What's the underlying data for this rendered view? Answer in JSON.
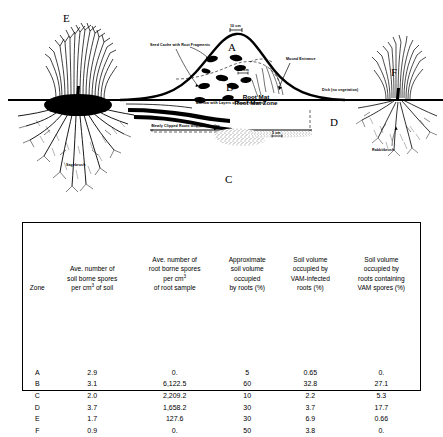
{
  "figure": {
    "zone_letters": [
      {
        "id": "E",
        "label": "E"
      },
      {
        "id": "A",
        "label": "A"
      },
      {
        "id": "B",
        "label": "B"
      },
      {
        "id": "C",
        "label": "C"
      },
      {
        "id": "D",
        "label": "D"
      },
      {
        "id": "F",
        "label": "F"
      }
    ],
    "annotations": {
      "scale_top": "10 cm",
      "scale_mid": "10 cm",
      "scale_bottom": "5 cm",
      "seed_cache": "Seed Cache with Root Fragments",
      "mound_entrance": "Mound Entrance",
      "root_mat_zone": "Root Mat Zone",
      "burrow": "Burrow with Layers of Root Fragments",
      "newly_clipped": "Newly Clipped Roots with Arbuscules",
      "disk": "Disk (no vegetation)",
      "sagebrush": "Sagebrush",
      "rabbitbrush": "Rabbitbrush"
    }
  },
  "table": {
    "headers": [
      {
        "lines": [
          "Zone"
        ],
        "sup": null
      },
      {
        "lines": [
          "Ave. number of",
          "soil borne spores",
          "per cm",
          " of soil"
        ],
        "sup": "3"
      },
      {
        "lines": [
          "Ave. number of",
          "root borne spores",
          "per cm",
          "of root sample"
        ],
        "sup": "3"
      },
      {
        "lines": [
          "Approximate",
          "soil volume",
          "occupied",
          "by roots (%)"
        ],
        "sup": null
      },
      {
        "lines": [
          "Soil volume",
          "occupied by",
          "VAM-infected",
          "roots (%)"
        ],
        "sup": null
      },
      {
        "lines": [
          "Soil volume",
          "occupied by",
          "roots containing",
          "VAM spores (%)"
        ],
        "sup": null
      }
    ],
    "rows": [
      {
        "zone": "A",
        "soil_spores": "2.9",
        "root_spores": "0.",
        "vol_roots": "5",
        "vol_vam_roots": "0.65",
        "vol_vam_spores": "0."
      },
      {
        "zone": "B",
        "soil_spores": "3.1",
        "root_spores": "6,122.5",
        "vol_roots": "60",
        "vol_vam_roots": "32.8",
        "vol_vam_spores": "27.1"
      },
      {
        "zone": "C",
        "soil_spores": "2.0",
        "root_spores": "2,209.2",
        "vol_roots": "10",
        "vol_vam_roots": "2.2",
        "vol_vam_spores": "5.3"
      },
      {
        "zone": "D",
        "soil_spores": "3.7",
        "root_spores": "1,658.2",
        "vol_roots": "30",
        "vol_vam_roots": "3.7",
        "vol_vam_spores": "17.7"
      },
      {
        "zone": "E",
        "soil_spores": "1.7",
        "root_spores": "127.6",
        "vol_roots": "30",
        "vol_vam_roots": "6.9",
        "vol_vam_spores": "0.66"
      },
      {
        "zone": "F",
        "soil_spores": "0.9",
        "root_spores": "0.",
        "vol_roots": "50",
        "vol_vam_roots": "3.8",
        "vol_vam_spores": "0."
      }
    ]
  },
  "colors": {
    "ink": "#000000",
    "paper": "#ffffff"
  }
}
